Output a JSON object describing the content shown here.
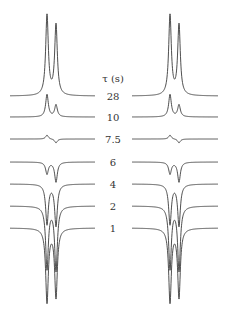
{
  "chart_data": {
    "type": "line",
    "title": "",
    "header_label": "τ (s)",
    "xlabel": "",
    "ylabel": "",
    "grid": false,
    "legend": "none",
    "categories": [
      "28",
      "10",
      "7.5",
      "6",
      "4",
      "2",
      "1"
    ],
    "series_rows": [
      {
        "tau": "28",
        "baseline_y": 96,
        "peak1_intensity": 1.0,
        "peak2_intensity": 0.88
      },
      {
        "tau": "10",
        "baseline_y": 117,
        "peak1_intensity": 0.28,
        "peak2_intensity": 0.15
      },
      {
        "tau": "7.5",
        "baseline_y": 139,
        "peak1_intensity": 0.05,
        "peak2_intensity": -0.05
      },
      {
        "tau": "6",
        "baseline_y": 162,
        "peak1_intensity": -0.15,
        "peak2_intensity": -0.25
      },
      {
        "tau": "4",
        "baseline_y": 184,
        "peak1_intensity": -0.5,
        "peak2_intensity": -0.52
      },
      {
        "tau": "2",
        "baseline_y": 206,
        "peak1_intensity": -0.78,
        "peak2_intensity": -0.8
      },
      {
        "tau": "1",
        "baseline_y": 228,
        "peak1_intensity": -0.92,
        "peak2_intensity": -0.86
      }
    ],
    "panels": [
      {
        "name": "left",
        "x_start": 10,
        "x_end": 95,
        "peak1_x": 47,
        "peak2_x": 56
      },
      {
        "name": "right",
        "x_start": 132,
        "x_end": 218,
        "peak1_x": 170,
        "peak2_x": 179
      }
    ],
    "peak_scale_px": 80,
    "line_width_px": 1.6,
    "colors": {
      "trace": "#3a3a3a",
      "label": "#333333",
      "background": "#ffffff"
    }
  },
  "labels": {
    "header": "τ (s)",
    "tau_values": [
      "28",
      "10",
      "7.5",
      "6",
      "4",
      "2",
      "1"
    ]
  }
}
